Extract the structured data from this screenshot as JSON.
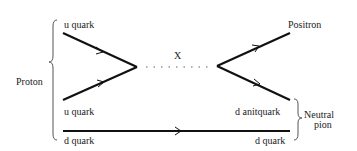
{
  "diagram": {
    "labels": {
      "u_quark_top": "u quark",
      "u_quark_bottom": "u quark",
      "d_quark_left": "d quark",
      "proton": "Proton",
      "x_boson": "X",
      "positron": "Positron",
      "d_antiquark": "d anitquark",
      "d_quark_right": "d quark",
      "neutral": "Neutral",
      "pion": "pion"
    },
    "colors": {
      "line": "#111111",
      "dots": "#999999",
      "brace": "#555555",
      "text": "#222222"
    }
  }
}
